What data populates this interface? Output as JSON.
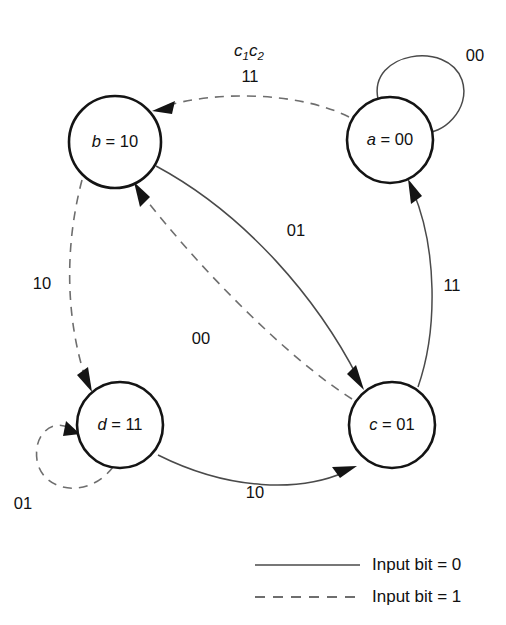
{
  "diagram": {
    "title_label": "c",
    "title_sub1": "1",
    "title_label2": "c",
    "title_sub2": "2",
    "nodes": [
      {
        "id": "a",
        "name_italic": "a",
        "equals": " = ",
        "value": "00",
        "full": "a = 00",
        "cx": 390,
        "cy": 140,
        "r": 43
      },
      {
        "id": "b",
        "name_italic": "b",
        "equals": " = ",
        "value": "10",
        "full": "b = 10",
        "cx": 115,
        "cy": 142,
        "r": 46
      },
      {
        "id": "c",
        "name_italic": "c",
        "equals": " = ",
        "value": "01",
        "full": "c = 01",
        "cx": 392,
        "cy": 425,
        "r": 43
      },
      {
        "id": "d",
        "name_italic": "d",
        "equals": " = ",
        "value": "11",
        "full": "d = 11",
        "cx": 120,
        "cy": 425,
        "r": 43
      }
    ],
    "edges": [
      {
        "id": "a-self",
        "from": "a",
        "to": "a",
        "label": "00",
        "style": "solid",
        "input_bit": 0
      },
      {
        "id": "a-to-b",
        "from": "a",
        "to": "b",
        "label": "11",
        "style": "dashed",
        "input_bit": 1
      },
      {
        "id": "b-to-c",
        "from": "b",
        "to": "c",
        "label": "01",
        "style": "solid",
        "input_bit": 0
      },
      {
        "id": "c-to-b",
        "from": "c",
        "to": "b",
        "label": "00",
        "style": "dashed",
        "input_bit": 1
      },
      {
        "id": "b-to-d",
        "from": "b",
        "to": "d",
        "label": "10",
        "style": "dashed",
        "input_bit": 1
      },
      {
        "id": "c-to-a",
        "from": "c",
        "to": "a",
        "label": "11",
        "style": "solid",
        "input_bit": 0
      },
      {
        "id": "d-to-c",
        "from": "d",
        "to": "c",
        "label": "10",
        "style": "solid",
        "input_bit": 0
      },
      {
        "id": "d-self",
        "from": "d",
        "to": "d",
        "label": "01",
        "style": "dashed",
        "input_bit": 1
      }
    ],
    "edge_labels": {
      "a_self": "00",
      "a_to_b": "11",
      "b_to_c": "01",
      "c_to_b": "00",
      "b_to_d": "10",
      "c_to_a": "11",
      "d_to_c": "10",
      "d_self": "01"
    },
    "legend": {
      "solid_label": "Input bit = 0",
      "dashed_label": "Input bit = 1"
    },
    "colors": {
      "node_stroke": "#141414",
      "solid_edge": "#4a4a4a",
      "dashed_edge": "#6e6e6e",
      "text": "#111111",
      "background": "#ffffff"
    }
  }
}
